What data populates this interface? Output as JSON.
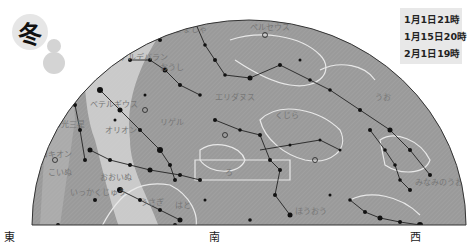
{
  "season": {
    "label": "冬",
    "icon": "snowman-icon"
  },
  "times": [
    "1月1日21時",
    "1月15日20時",
    "2月1日19時"
  ],
  "directions": {
    "east": "東",
    "south": "南",
    "west": "西"
  },
  "constellation_labels": [
    {
      "text": "ぎょしゃ",
      "x": 175,
      "y": 32
    },
    {
      "text": "アルデバラン",
      "x": 120,
      "y": 60
    },
    {
      "text": "ペルセウス",
      "x": 250,
      "y": 30
    },
    {
      "text": "おうし",
      "x": 160,
      "y": 70
    },
    {
      "text": "ベテルギウス",
      "x": 90,
      "y": 107
    },
    {
      "text": "リゲル",
      "x": 160,
      "y": 125
    },
    {
      "text": "オリオン",
      "x": 105,
      "y": 133
    },
    {
      "text": "ふたご",
      "x": 55,
      "y": 65
    },
    {
      "text": "きの光三星",
      "x": 45,
      "y": 127
    },
    {
      "text": "プロキオン",
      "x": 32,
      "y": 157
    },
    {
      "text": "こいぬ",
      "x": 48,
      "y": 175
    },
    {
      "text": "いっかくじゅう",
      "x": 70,
      "y": 195
    },
    {
      "text": "おおいぬ",
      "x": 100,
      "y": 180
    },
    {
      "text": "エリダヌス",
      "x": 215,
      "y": 100
    },
    {
      "text": "うさぎ",
      "x": 140,
      "y": 205
    },
    {
      "text": "はと",
      "x": 175,
      "y": 208
    },
    {
      "text": "くじら",
      "x": 275,
      "y": 118
    },
    {
      "text": "うお",
      "x": 375,
      "y": 100
    },
    {
      "text": "ろ",
      "x": 225,
      "y": 175
    },
    {
      "text": "ほうおう",
      "x": 295,
      "y": 214
    },
    {
      "text": "みなみのうお",
      "x": 415,
      "y": 185
    }
  ]
}
